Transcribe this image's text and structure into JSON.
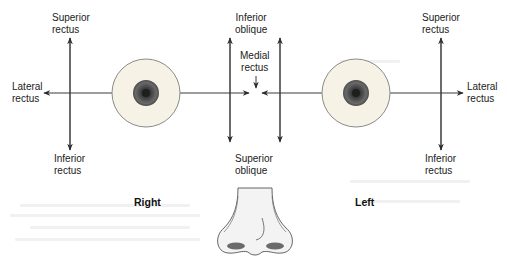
{
  "diagram": {
    "type": "extraocular-muscle-actions",
    "sides": {
      "right": {
        "label": "Right",
        "labels": {
          "superior_rectus": "Superior\nrectus",
          "lateral_rectus": "Lateral\nrectus",
          "inferior_rectus": "Inferior\nrectus"
        }
      },
      "left": {
        "label": "Left",
        "labels": {
          "superior_rectus": "Superior\nrectus",
          "lateral_rectus": "Lateral\nrectus",
          "inferior_rectus": "Inferior\nrectus"
        }
      }
    },
    "center_labels": {
      "inferior_oblique": "Inferior\noblique",
      "medial_rectus": "Medial\nrectus",
      "superior_oblique": "Superior\noblique"
    },
    "colors": {
      "line": "#3a3a3a",
      "sclera_fill": "#f6f3e6",
      "sclera_stroke": "#8a8a8a",
      "iris": "#5a5a5a",
      "pupil": "#2a2a2a",
      "nose_fill": "#f2f2f2",
      "nose_stroke": "#555555",
      "nostril": "#6a6a6a"
    }
  }
}
